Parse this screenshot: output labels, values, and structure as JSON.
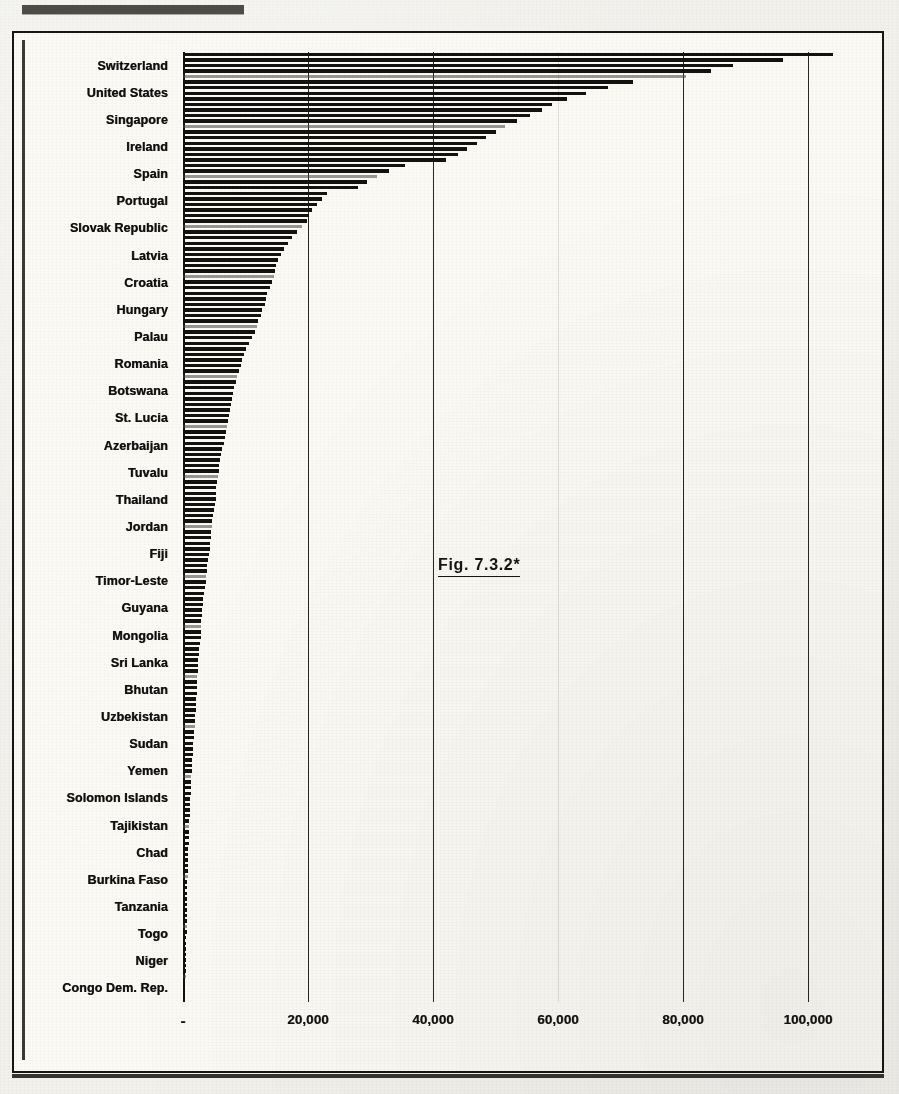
{
  "figure": {
    "caption": "Fig. 7.3.2*",
    "top_rule_label": ""
  },
  "chart_data": {
    "type": "bar",
    "orientation": "horizontal",
    "title": "Fig. 7.3.2*",
    "xlabel": "",
    "ylabel": "",
    "xlim": [
      0,
      112000
    ],
    "grid": true,
    "legend": false,
    "xticks": [
      {
        "value": 0,
        "label": "-"
      },
      {
        "value": 20000,
        "label": "20,000"
      },
      {
        "value": 40000,
        "label": "40,000"
      },
      {
        "value": 60000,
        "label": "60,000"
      },
      {
        "value": 80000,
        "label": "80,000"
      },
      {
        "value": 100000,
        "label": "100,000"
      }
    ],
    "note": "Labels shown on the y-axis are a subset; unlabeled bars sit between them.",
    "categories": [
      "Switzerland",
      "United States",
      "Singapore",
      "Ireland",
      "Spain",
      "Portugal",
      "Slovak Republic",
      "Latvia",
      "Croatia",
      "Hungary",
      "Palau",
      "Romania",
      "Botswana",
      "St. Lucia",
      "Azerbaijan",
      "Tuvalu",
      "Thailand",
      "Jordan",
      "Fiji",
      "Timor-Leste",
      "Guyana",
      "Mongolia",
      "Sri Lanka",
      "Bhutan",
      "Uzbekistan",
      "Sudan",
      "Yemen",
      "Solomon Islands",
      "Tajikistan",
      "Chad",
      "Burkina Faso",
      "Tanzania",
      "Togo",
      "Niger",
      "Congo Dem. Rep."
    ],
    "values": [
      104000,
      72000,
      57500,
      48500,
      35500,
      23000,
      19800,
      16200,
      14600,
      13100,
      11500,
      9500,
      8200,
      7400,
      6500,
      5700,
      5200,
      4600,
      4200,
      3600,
      3100,
      2800,
      2400,
      2200,
      1900,
      1600,
      1350,
      1150,
      980,
      800,
      700,
      620,
      520,
      420,
      340
    ],
    "all_bars": [
      104000,
      96000,
      88000,
      84500,
      80500,
      72000,
      68000,
      64500,
      61500,
      59000,
      57500,
      55500,
      53500,
      51500,
      50000,
      48500,
      47000,
      45500,
      44000,
      42000,
      35500,
      33000,
      31000,
      29500,
      28000,
      23000,
      22200,
      21400,
      20600,
      20100,
      19800,
      19000,
      18200,
      17400,
      16800,
      16200,
      15700,
      15200,
      14900,
      14750,
      14600,
      14200,
      13900,
      13500,
      13300,
      13100,
      12700,
      12400,
      12000,
      11800,
      11500,
      11000,
      10600,
      10100,
      9800,
      9500,
      9200,
      8900,
      8600,
      8400,
      8200,
      8000,
      7800,
      7600,
      7500,
      7400,
      7200,
      7000,
      6800,
      6650,
      6500,
      6300,
      6100,
      5950,
      5800,
      5700,
      5550,
      5450,
      5350,
      5250,
      5200,
      5050,
      4900,
      4800,
      4700,
      4600,
      4500,
      4400,
      4320,
      4260,
      4200,
      4050,
      3900,
      3800,
      3700,
      3600,
      3480,
      3360,
      3260,
      3180,
      3100,
      3000,
      2940,
      2880,
      2840,
      2800,
      2700,
      2620,
      2540,
      2470,
      2400,
      2340,
      2290,
      2250,
      2220,
      2200,
      2130,
      2060,
      2000,
      1950,
      1900,
      1840,
      1780,
      1720,
      1660,
      1600,
      1550,
      1500,
      1450,
      1400,
      1350,
      1300,
      1260,
      1210,
      1180,
      1150,
      1110,
      1070,
      1030,
      1000,
      980,
      940,
      900,
      870,
      835,
      800,
      775,
      755,
      735,
      715,
      700,
      685,
      670,
      655,
      640,
      620,
      600,
      585,
      565,
      545,
      520,
      500,
      480,
      460,
      440,
      420,
      405,
      390,
      370,
      355,
      340
    ]
  }
}
